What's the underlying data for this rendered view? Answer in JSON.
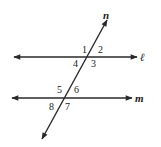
{
  "diagram": {
    "lines": {
      "l": {
        "label": "ℓ"
      },
      "m": {
        "label": "m"
      },
      "n": {
        "label": "n"
      }
    },
    "angles": {
      "a1": "1",
      "a2": "2",
      "a3": "3",
      "a4": "4",
      "a5": "5",
      "a6": "6",
      "a7": "7",
      "a8": "8"
    },
    "colors": {
      "stroke": "#2a2a2a",
      "background": "#ffffff"
    }
  }
}
